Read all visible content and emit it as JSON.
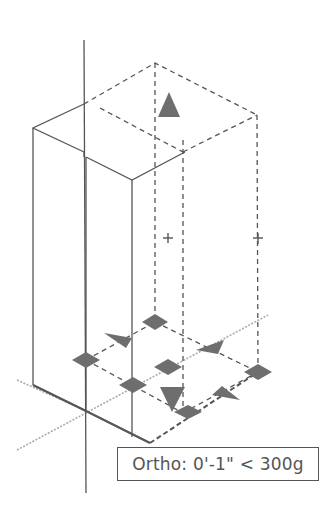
{
  "tooltip": {
    "text": "Ortho: 0'-1\" < 300g"
  },
  "colors": {
    "background": "#ffffff",
    "solid_line": "#555555",
    "dashed_line": "#555555",
    "tracking_line": "#aaaaaa",
    "grip_fill": "#6e6e6e",
    "tooltip_border": "#555555",
    "tooltip_text": "#555555"
  },
  "drawing": {
    "description": "Isometric 3D box being stretched with grips; dashed preview box shows new extents",
    "axis_vertical": {
      "x": 84,
      "y1": 40,
      "y2": 493
    },
    "solid_box": {
      "top_left": [
        33,
        128
      ],
      "top_back": [
        84,
        104
      ],
      "top_inner": [
        84,
        152
      ],
      "notch": [
        86,
        157
      ],
      "front_top": [
        132,
        180
      ],
      "right_top": [
        185,
        152
      ],
      "bottom_left": [
        33,
        385
      ],
      "bottom_origin": [
        84,
        410
      ],
      "bottom_front": [
        132,
        437
      ]
    },
    "dashed_box": {
      "top": [
        155,
        63
      ],
      "right_top": [
        257,
        115
      ],
      "left_top": [
        84,
        104
      ],
      "front_top": [
        183,
        140
      ],
      "bottom_back": [
        155,
        322
      ],
      "bottom_right": [
        258,
        372
      ],
      "bottom_front": [
        183,
        413
      ]
    },
    "grips": [
      {
        "type": "triangle-up",
        "cx": 169,
        "cy": 104
      },
      {
        "type": "cross",
        "cx": 168,
        "cy": 238
      },
      {
        "type": "cross",
        "cx": 258,
        "cy": 238
      },
      {
        "type": "diamond",
        "cx": 155,
        "cy": 322
      },
      {
        "type": "arrow-left",
        "cx": 120,
        "cy": 340
      },
      {
        "type": "diamond",
        "cx": 86,
        "cy": 360
      },
      {
        "type": "diamond",
        "cx": 168,
        "cy": 367
      },
      {
        "type": "arrow-right",
        "cx": 212,
        "cy": 347
      },
      {
        "type": "diamond",
        "cx": 258,
        "cy": 372
      },
      {
        "type": "diamond",
        "cx": 133,
        "cy": 385
      },
      {
        "type": "triangle-down",
        "cx": 172,
        "cy": 398
      },
      {
        "type": "arrow-right",
        "cx": 228,
        "cy": 394
      },
      {
        "type": "diamond",
        "cx": 188,
        "cy": 412
      }
    ]
  }
}
